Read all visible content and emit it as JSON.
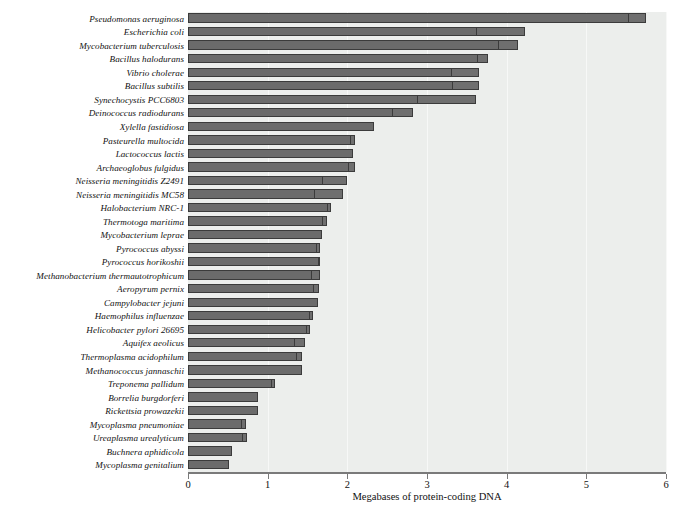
{
  "chart_data": {
    "type": "bar",
    "orientation": "horizontal",
    "title": "",
    "xlabel": "Megabases of protein-coding DNA",
    "ylabel": "",
    "xlim": [
      0,
      6
    ],
    "xticks": [
      0,
      1,
      2,
      3,
      4,
      5,
      6
    ],
    "xticklabels": [
      "0",
      "1",
      "2",
      "3",
      "4",
      "5",
      "6"
    ],
    "grid": true,
    "legend": "none",
    "categories": [
      "Pseudomonas aeruginosa",
      "Escherichia coli",
      "Mycobacterium tuberculosis",
      "Bacillus halodurans",
      "Vibrio cholerae",
      "Bacillus subtilis",
      "Synechocystis PCC6803",
      "Deinococcus radiodurans",
      "Xylella fastidiosa",
      "Pasteurella multocida",
      "Lactococcus lactis",
      "Archaeoglobus fulgidus",
      "Neisseria meningitidis Z2491",
      "Neisseria meningitidis MC58",
      "Halobacterium NRC-1",
      "Thermotoga maritima",
      "Mycobacterium leprae",
      "Pyrococcus abyssi",
      "Pyrococcus horikoshii",
      "Methanobacterium thermautotrophicum",
      "Aeropyrum pernix",
      "Campylobacter jejuni",
      "Haemophilus influenzae",
      "Helicobacter pylori 26695",
      "Aquifex aeolicus",
      "Thermoplasma acidophilum",
      "Methanococcus jannaschii",
      "Treponema pallidum",
      "Borrelia burgdorferi",
      "Rickettsia prowazekii",
      "Mycoplasma pneumoniae",
      "Ureaplasma urealyticum",
      "Buchnera aphidicola",
      "Mycoplasma genitalium"
    ],
    "values": [
      5.75,
      4.23,
      4.14,
      3.77,
      3.65,
      3.65,
      3.61,
      2.83,
      2.34,
      2.1,
      2.07,
      2.09,
      2.0,
      1.95,
      1.8,
      1.75,
      1.68,
      1.66,
      1.66,
      1.66,
      1.64,
      1.63,
      1.57,
      1.53,
      1.47,
      1.43,
      1.43,
      1.09,
      0.88,
      0.88,
      0.73,
      0.74,
      0.55,
      0.51
    ],
    "tip_segment_values": [
      0.22,
      0.6,
      0.24,
      0.13,
      0.34,
      0.33,
      0.72,
      0.26,
      0.0,
      0.06,
      0.0,
      0.07,
      0.3,
      0.36,
      0.04,
      0.05,
      0.0,
      0.04,
      0.02,
      0.1,
      0.06,
      0.0,
      0.04,
      0.04,
      0.13,
      0.06,
      0.0,
      0.03,
      0.0,
      0.0,
      0.05,
      0.05,
      0.0,
      0.0
    ],
    "colors": {
      "bar_fill": "#6b6b6b",
      "bar_edge": "#3b3b3b",
      "plot_background": "#eceeec",
      "gridline": "#f7f8f7",
      "axis": "#7a7a7a",
      "text": "#111111"
    }
  },
  "caption": {
    "text": ""
  }
}
